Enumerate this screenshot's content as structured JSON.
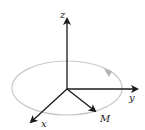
{
  "diagram": {
    "title": "",
    "axes": {
      "x": {
        "label": "x"
      },
      "y": {
        "label": "y"
      },
      "z": {
        "label": "z"
      }
    },
    "vector": {
      "label": "M"
    },
    "orbit": {
      "description": "precession path",
      "color": "#c8c8c8",
      "arrow_color": "#b4b4b4"
    },
    "colors": {
      "axis": "#1a1a1a",
      "background": "#ffffff"
    }
  }
}
